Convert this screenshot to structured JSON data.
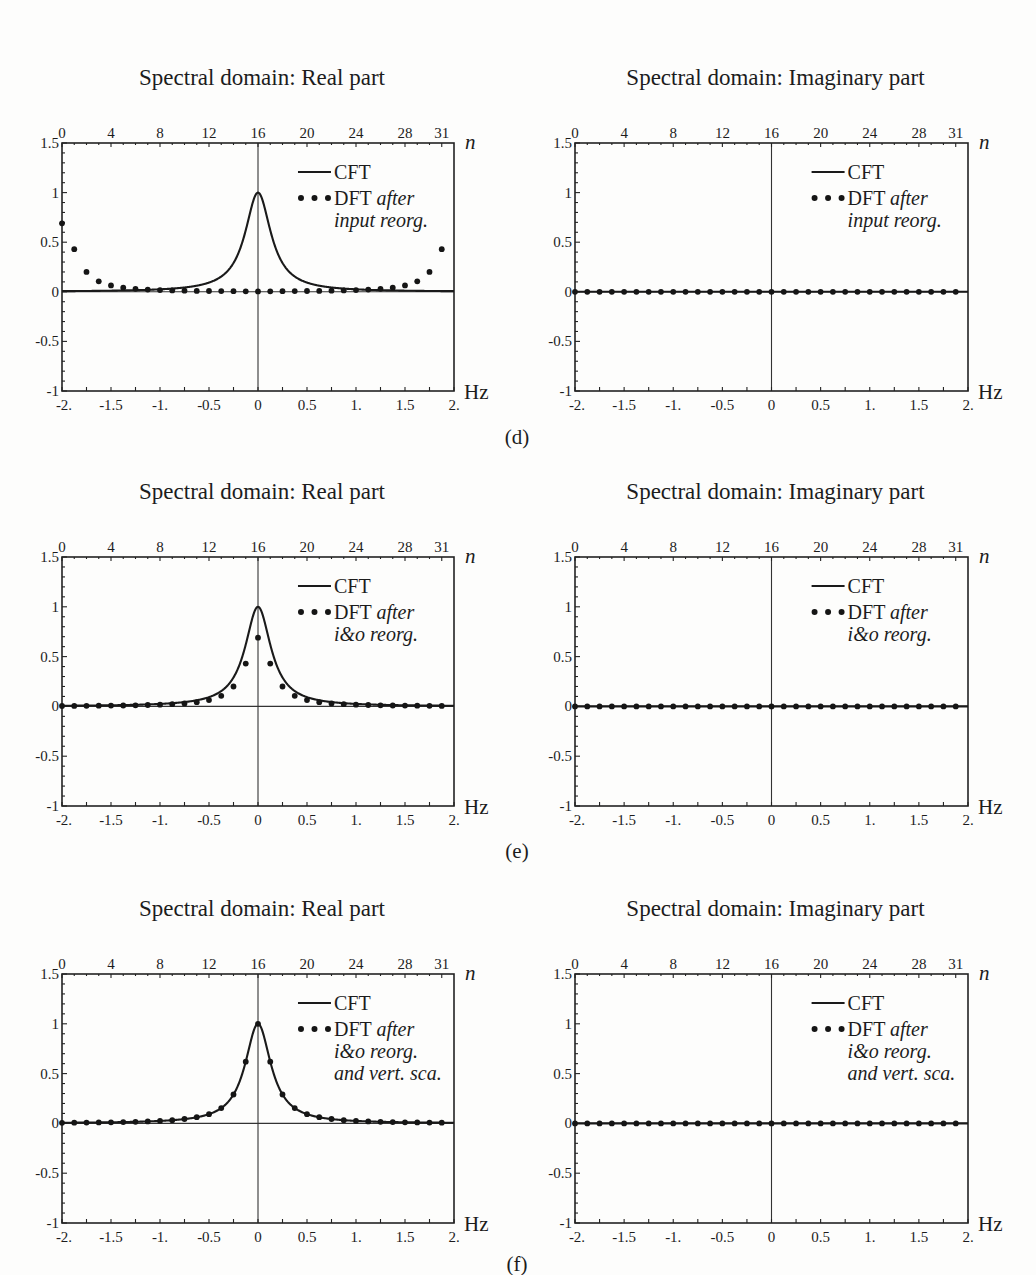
{
  "figure": {
    "panel_labels": [
      "(d)",
      "(e)",
      "(f)"
    ]
  },
  "chart_data": [
    {
      "panel": "(d)",
      "side": "left",
      "type": "line+scatter",
      "title": "Spectral domain: Real part",
      "xlabel": "Hz",
      "x2label": "n",
      "ylabel": "",
      "xlim": [
        -2,
        2
      ],
      "ylim": [
        -1,
        1.5
      ],
      "xticks": [
        "-2.",
        "-1.5",
        "-1.",
        "-0.5",
        "0",
        "0.5",
        "1.",
        "1.5",
        "2."
      ],
      "yticks": [
        "1.5",
        "1",
        "0.5",
        "0",
        "-0.5",
        "-1"
      ],
      "x2ticks": [
        "0",
        "4",
        "8",
        "12",
        "16",
        "20",
        "24",
        "28",
        "31"
      ],
      "legend": {
        "line": "CFT",
        "dots": "DFT",
        "dots_note": [
          "after",
          "input reorg."
        ]
      },
      "series": [
        {
          "name": "CFT",
          "kind": "line",
          "model": "lorentzian",
          "half_width_hz": 0.16,
          "peak": 1.0
        },
        {
          "name": "DFT after input reorg.",
          "kind": "dots",
          "n": [
            0,
            1,
            2,
            3,
            4,
            5,
            6,
            7,
            8,
            9,
            10,
            11,
            12,
            13,
            14,
            15,
            16,
            17,
            18,
            19,
            20,
            21,
            22,
            23,
            24,
            25,
            26,
            27,
            28,
            29,
            30,
            31
          ],
          "values": [
            0.69,
            0.43,
            0.2,
            0.106,
            0.064,
            0.042,
            0.03,
            0.022,
            0.017,
            0.014,
            0.011,
            0.009,
            0.008,
            0.007,
            0.006,
            0.005,
            0.004,
            0.005,
            0.006,
            0.007,
            0.008,
            0.009,
            0.011,
            0.014,
            0.017,
            0.022,
            0.03,
            0.042,
            0.064,
            0.106,
            0.2,
            0.43
          ]
        }
      ]
    },
    {
      "panel": "(d)",
      "side": "right",
      "type": "line+scatter",
      "title": "Spectral domain: Imaginary part",
      "xlabel": "Hz",
      "x2label": "n",
      "xlim": [
        -2,
        2
      ],
      "ylim": [
        -1,
        1.5
      ],
      "xticks": [
        "-2.",
        "-1.5",
        "-1.",
        "-0.5",
        "0",
        "0.5",
        "1.",
        "1.5",
        "2."
      ],
      "yticks": [
        "1.5",
        "1",
        "0.5",
        "0",
        "-0.5",
        "-1"
      ],
      "x2ticks": [
        "0",
        "4",
        "8",
        "12",
        "16",
        "20",
        "24",
        "28",
        "31"
      ],
      "legend": {
        "line": "CFT",
        "dots": "DFT",
        "dots_note": [
          "after",
          "input reorg."
        ]
      },
      "series": [
        {
          "name": "CFT",
          "kind": "line",
          "model": "zero"
        },
        {
          "name": "DFT after input reorg.",
          "kind": "dots",
          "n": [
            0,
            1,
            2,
            3,
            4,
            5,
            6,
            7,
            8,
            9,
            10,
            11,
            12,
            13,
            14,
            15,
            16,
            17,
            18,
            19,
            20,
            21,
            22,
            23,
            24,
            25,
            26,
            27,
            28,
            29,
            30,
            31
          ],
          "values": [
            0,
            0,
            0,
            0,
            0,
            0,
            0,
            0,
            0,
            0,
            0,
            0,
            0,
            0,
            0,
            0,
            0,
            0,
            0,
            0,
            0,
            0,
            0,
            0,
            0,
            0,
            0,
            0,
            0,
            0,
            0,
            0
          ]
        }
      ]
    },
    {
      "panel": "(e)",
      "side": "left",
      "type": "line+scatter",
      "title": "Spectral domain: Real part",
      "xlabel": "Hz",
      "x2label": "n",
      "xlim": [
        -2,
        2
      ],
      "ylim": [
        -1,
        1.5
      ],
      "xticks": [
        "-2.",
        "-1.5",
        "-1.",
        "-0.5",
        "0",
        "0.5",
        "1.",
        "1.5",
        "2."
      ],
      "yticks": [
        "1.5",
        "1",
        "0.5",
        "0",
        "-0.5",
        "-1"
      ],
      "x2ticks": [
        "0",
        "4",
        "8",
        "12",
        "16",
        "20",
        "24",
        "28",
        "31"
      ],
      "legend": {
        "line": "CFT",
        "dots": "DFT",
        "dots_note": [
          "after",
          "i&o reorg."
        ]
      },
      "series": [
        {
          "name": "CFT",
          "kind": "line",
          "model": "lorentzian",
          "half_width_hz": 0.16,
          "peak": 1.0
        },
        {
          "name": "DFT after i&o reorg.",
          "kind": "dots",
          "n": [
            0,
            1,
            2,
            3,
            4,
            5,
            6,
            7,
            8,
            9,
            10,
            11,
            12,
            13,
            14,
            15,
            16,
            17,
            18,
            19,
            20,
            21,
            22,
            23,
            24,
            25,
            26,
            27,
            28,
            29,
            30,
            31
          ],
          "values": [
            0.004,
            0.005,
            0.006,
            0.007,
            0.008,
            0.009,
            0.011,
            0.014,
            0.017,
            0.022,
            0.03,
            0.042,
            0.064,
            0.106,
            0.2,
            0.43,
            0.69,
            0.43,
            0.2,
            0.106,
            0.064,
            0.042,
            0.03,
            0.022,
            0.017,
            0.014,
            0.011,
            0.009,
            0.008,
            0.007,
            0.006,
            0.005
          ]
        }
      ]
    },
    {
      "panel": "(e)",
      "side": "right",
      "type": "line+scatter",
      "title": "Spectral domain: Imaginary part",
      "xlabel": "Hz",
      "x2label": "n",
      "xlim": [
        -2,
        2
      ],
      "ylim": [
        -1,
        1.5
      ],
      "xticks": [
        "-2.",
        "-1.5",
        "-1.",
        "-0.5",
        "0",
        "0.5",
        "1.",
        "1.5",
        "2."
      ],
      "yticks": [
        "1.5",
        "1",
        "0.5",
        "0",
        "-0.5",
        "-1"
      ],
      "x2ticks": [
        "0",
        "4",
        "8",
        "12",
        "16",
        "20",
        "24",
        "28",
        "31"
      ],
      "legend": {
        "line": "CFT",
        "dots": "DFT",
        "dots_note": [
          "after",
          "i&o reorg."
        ]
      },
      "series": [
        {
          "name": "CFT",
          "kind": "line",
          "model": "zero"
        },
        {
          "name": "DFT after i&o reorg.",
          "kind": "dots",
          "n": [
            0,
            1,
            2,
            3,
            4,
            5,
            6,
            7,
            8,
            9,
            10,
            11,
            12,
            13,
            14,
            15,
            16,
            17,
            18,
            19,
            20,
            21,
            22,
            23,
            24,
            25,
            26,
            27,
            28,
            29,
            30,
            31
          ],
          "values": [
            0,
            0,
            0,
            0,
            0,
            0,
            0,
            0,
            0,
            0,
            0,
            0,
            0,
            0,
            0,
            0,
            0,
            0,
            0,
            0,
            0,
            0,
            0,
            0,
            0,
            0,
            0,
            0,
            0,
            0,
            0,
            0
          ]
        }
      ]
    },
    {
      "panel": "(f)",
      "side": "left",
      "type": "line+scatter",
      "title": "Spectral domain: Real part",
      "xlabel": "Hz",
      "x2label": "n",
      "xlim": [
        -2,
        2
      ],
      "ylim": [
        -1,
        1.5
      ],
      "xticks": [
        "-2.",
        "-1.5",
        "-1.",
        "-0.5",
        "0",
        "0.5",
        "1.",
        "1.5",
        "2."
      ],
      "yticks": [
        "1.5",
        "1",
        "0.5",
        "0",
        "-0.5",
        "-1"
      ],
      "x2ticks": [
        "0",
        "4",
        "8",
        "12",
        "16",
        "20",
        "24",
        "28",
        "31"
      ],
      "legend": {
        "line": "CFT",
        "dots": "DFT",
        "dots_note": [
          "after",
          "i&o reorg.",
          "and vert. sca."
        ]
      },
      "series": [
        {
          "name": "CFT",
          "kind": "line",
          "model": "lorentzian",
          "half_width_hz": 0.16,
          "peak": 1.0
        },
        {
          "name": "DFT after i&o reorg. and vert. sca.",
          "kind": "dots",
          "n": [
            0,
            1,
            2,
            3,
            4,
            5,
            6,
            7,
            8,
            9,
            10,
            11,
            12,
            13,
            14,
            15,
            16,
            17,
            18,
            19,
            20,
            21,
            22,
            23,
            24,
            25,
            26,
            27,
            28,
            29,
            30,
            31
          ],
          "values": [
            0.006,
            0.007,
            0.008,
            0.01,
            0.011,
            0.013,
            0.016,
            0.02,
            0.025,
            0.032,
            0.044,
            0.062,
            0.093,
            0.154,
            0.29,
            0.62,
            1.0,
            0.62,
            0.29,
            0.154,
            0.093,
            0.062,
            0.044,
            0.032,
            0.025,
            0.02,
            0.016,
            0.013,
            0.011,
            0.01,
            0.008,
            0.007
          ]
        }
      ]
    },
    {
      "panel": "(f)",
      "side": "right",
      "type": "line+scatter",
      "title": "Spectral domain: Imaginary part",
      "xlabel": "Hz",
      "x2label": "n",
      "xlim": [
        -2,
        2
      ],
      "ylim": [
        -1,
        1.5
      ],
      "xticks": [
        "-2.",
        "-1.5",
        "-1.",
        "-0.5",
        "0",
        "0.5",
        "1.",
        "1.5",
        "2."
      ],
      "yticks": [
        "1.5",
        "1",
        "0.5",
        "0",
        "-0.5",
        "-1"
      ],
      "x2ticks": [
        "0",
        "4",
        "8",
        "12",
        "16",
        "20",
        "24",
        "28",
        "31"
      ],
      "legend": {
        "line": "CFT",
        "dots": "DFT",
        "dots_note": [
          "after",
          "i&o reorg.",
          "and vert. sca."
        ]
      },
      "series": [
        {
          "name": "CFT",
          "kind": "line",
          "model": "zero"
        },
        {
          "name": "DFT after i&o reorg. and vert. sca.",
          "kind": "dots",
          "n": [
            0,
            1,
            2,
            3,
            4,
            5,
            6,
            7,
            8,
            9,
            10,
            11,
            12,
            13,
            14,
            15,
            16,
            17,
            18,
            19,
            20,
            21,
            22,
            23,
            24,
            25,
            26,
            27,
            28,
            29,
            30,
            31
          ],
          "values": [
            0,
            0,
            0,
            0,
            0,
            0,
            0,
            0,
            0,
            0,
            0,
            0,
            0,
            0,
            0,
            0,
            0,
            0,
            0,
            0,
            0,
            0,
            0,
            0,
            0,
            0,
            0,
            0,
            0,
            0,
            0,
            0
          ]
        }
      ]
    }
  ]
}
